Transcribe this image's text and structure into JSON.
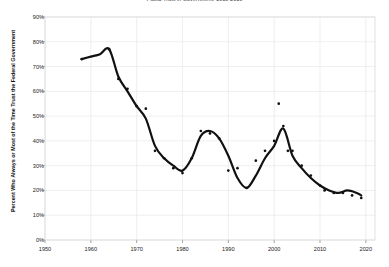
{
  "chart_data": {
    "type": "line",
    "title": "Public Trust in Government: 1958-2019",
    "xlabel": "",
    "ylabel": "Percent Who Always or Most of the Time Trust the Federal Government",
    "xlim": [
      1950,
      2022
    ],
    "ylim": [
      0,
      90
    ],
    "xticks": [
      1950,
      1960,
      1970,
      1980,
      1990,
      2000,
      2010,
      2020
    ],
    "xtick_labels": [
      "1950",
      "1960",
      "1970",
      "1980",
      "1990",
      "2000",
      "2010",
      "2020"
    ],
    "yticks": [
      0,
      10,
      20,
      30,
      40,
      50,
      60,
      70,
      80,
      90
    ],
    "ytick_labels": [
      "0%",
      "10%",
      "20%",
      "30%",
      "40%",
      "50%",
      "60%",
      "70%",
      "80%",
      "90%"
    ],
    "grid": true,
    "legend": "none",
    "line_color": "#111111",
    "marker_color": "#111111",
    "grid_color": "#e8e8e8",
    "background_color": "#ffffff",
    "series": [
      {
        "name": "Trust the federal government (scatter observations)",
        "marker": "dot",
        "x": [
          1958,
          1964,
          1966,
          1968,
          1970,
          1972,
          1974,
          1976,
          1978,
          1980,
          1982,
          1984,
          1986,
          1988,
          1990,
          1992,
          1994,
          1996,
          1998,
          2000,
          2001,
          2002,
          2003,
          2004,
          2006,
          2008,
          2010,
          2011,
          2013,
          2015,
          2017,
          2019
        ],
        "values": [
          73,
          77,
          65,
          61,
          54,
          53,
          36,
          33,
          29,
          27,
          33,
          44,
          43,
          41,
          28,
          29,
          21,
          32,
          36,
          40,
          55,
          46,
          36,
          36,
          30,
          26,
          22,
          20,
          19,
          19,
          18,
          17
        ]
      },
      {
        "name": "Trust the federal government (smoothed trend)",
        "marker": "line",
        "x": [
          1958,
          1960,
          1962,
          1964,
          1966,
          1968,
          1970,
          1972,
          1974,
          1976,
          1978,
          1980,
          1982,
          1984,
          1986,
          1988,
          1990,
          1992,
          1994,
          1996,
          1998,
          2000,
          2002,
          2004,
          2006,
          2008,
          2010,
          2012,
          2014,
          2016,
          2018,
          2019
        ],
        "values": [
          73,
          74,
          75,
          77,
          66,
          60,
          54,
          49,
          38,
          33,
          30,
          28,
          33,
          42,
          44,
          41,
          34,
          25,
          21,
          26,
          33,
          38,
          45,
          34,
          29,
          25,
          22,
          20,
          19,
          20,
          19,
          18
        ]
      }
    ],
    "annotations": []
  }
}
